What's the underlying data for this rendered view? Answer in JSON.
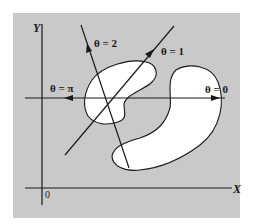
{
  "figure": {
    "background_color": "#ffffff",
    "panel_color": "#c9c9c9",
    "line_color": "#1a1a1a",
    "region_fill": "#ffffff"
  },
  "axes": {
    "x_label": "X",
    "y_label": "Y",
    "origin_label": "0"
  },
  "rays": [
    {
      "id": "theta-0",
      "label": "θ = 0",
      "direction": "right"
    },
    {
      "id": "theta-pi",
      "label": "θ = π",
      "direction": "left"
    },
    {
      "id": "theta-1",
      "label": "θ = 1",
      "direction": "up-right"
    },
    {
      "id": "theta-2",
      "label": "θ = 2",
      "direction": "up-left"
    }
  ],
  "regions": [
    {
      "id": "upper-left-blob",
      "description": "bean-shaped white region"
    },
    {
      "id": "lower-right-crescent",
      "description": "curved crescent-shaped white region"
    }
  ]
}
